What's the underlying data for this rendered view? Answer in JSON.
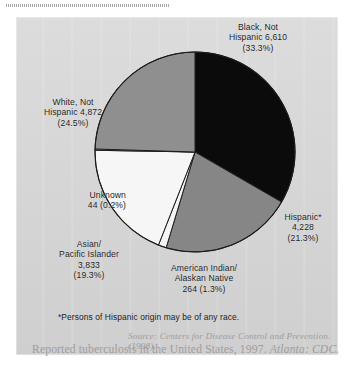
{
  "figure": {
    "footnote": "*Persons of Hispanic origin may be of any race.",
    "source_line_1": "Source: Centers for Disease Control and Prevention. (1998).",
    "source_line_2_plain": "Reported tuberculosis in the United States, 1997. ",
    "source_line_2_italic": "Atlanta: CDC."
  },
  "chart_data": {
    "type": "pie",
    "title": "",
    "total": 19847,
    "units": "cases",
    "start_angle_deg": 0,
    "direction": "clockwise",
    "legend": "none (direct labels)",
    "categories": [
      "Black, Not Hispanic",
      "Hispanic*",
      "American Indian/ Alaskan Native",
      "Asian/ Pacific Islander",
      "Unknown",
      "White, Not Hispanic"
    ],
    "values": [
      6610,
      4228,
      264,
      3833,
      44,
      4872
    ],
    "percents": [
      33.3,
      21.3,
      1.3,
      19.3,
      0.2,
      24.5
    ],
    "colors": [
      "#0b0b0b",
      "#868686",
      "#f4f4f4",
      "#f6f6f6",
      "#f6f6f6",
      "#8f8f8f"
    ],
    "slices": [
      {
        "name": "Black, Not Hispanic",
        "value": 6610,
        "value_label": "6,610",
        "percent": 33.3,
        "percent_label": "(33.3%)",
        "color": "#0b0b0b",
        "label_text": "Black, Not\nHispanic 6,610\n(33.3%)"
      },
      {
        "name": "Hispanic*",
        "value": 4228,
        "value_label": "4,228",
        "percent": 21.3,
        "percent_label": "(21.3%)",
        "color": "#868686",
        "label_text": "Hispanic*\n4,228\n(21.3%)"
      },
      {
        "name": "American Indian/ Alaskan Native",
        "value": 264,
        "value_label": "264",
        "percent": 1.3,
        "percent_label": "(1.3%)",
        "color": "#f4f4f4",
        "label_text": "American Indian/\nAlaskan Native\n264 (1.3%)"
      },
      {
        "name": "Asian/ Pacific Islander",
        "value": 3833,
        "value_label": "3,833",
        "percent": 19.3,
        "percent_label": "(19.3%)",
        "color": "#f6f6f6",
        "label_text": "Asian/\nPacific Islander\n3,833\n(19.3%)"
      },
      {
        "name": "Unknown",
        "value": 44,
        "value_label": "44",
        "percent": 0.2,
        "percent_label": "(0.2%)",
        "color": "#f6f6f6",
        "label_text": "Unknown\n44 (0.2%)"
      },
      {
        "name": "White, Not Hispanic",
        "value": 4872,
        "value_label": "4,872",
        "percent": 24.5,
        "percent_label": "(24.5%)",
        "color": "#8f8f8f",
        "label_text": "White, Not\nHispanic 4,872\n(24.5%)"
      }
    ]
  }
}
